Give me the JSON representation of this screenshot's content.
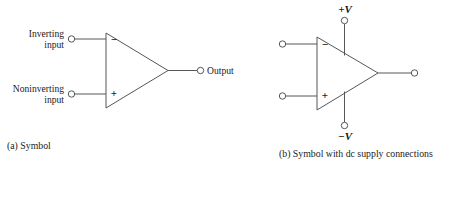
{
  "figure": {
    "background_color": "#ffffff",
    "line_color": "#55565a",
    "text_color": "#1a1a1a",
    "panels": [
      {
        "id": "a",
        "caption": "(a) Symbol",
        "component": "operational-amplifier",
        "terminals": [
          {
            "name": "inverting-input",
            "label_line1": "Inverting",
            "label_line2": "input",
            "sign": "−"
          },
          {
            "name": "noninverting-input",
            "label_line1": "Noninverting",
            "label_line2": "input",
            "sign": "+"
          },
          {
            "name": "output",
            "label_line1": "Output",
            "label_line2": "",
            "sign": ""
          }
        ]
      },
      {
        "id": "b",
        "caption": "(b) Symbol with dc supply connections",
        "component": "operational-amplifier",
        "terminals": [
          {
            "name": "inverting-input",
            "label_line1": "",
            "label_line2": "",
            "sign": "−"
          },
          {
            "name": "noninverting-input",
            "label_line1": "",
            "label_line2": "",
            "sign": "+"
          },
          {
            "name": "output",
            "label_line1": "",
            "label_line2": "",
            "sign": ""
          }
        ],
        "supplies": [
          {
            "name": "positive-supply",
            "sign": "+",
            "symbol": "V",
            "label": "+V"
          },
          {
            "name": "negative-supply",
            "sign": "−",
            "symbol": "V",
            "label": "−V"
          }
        ]
      }
    ]
  }
}
